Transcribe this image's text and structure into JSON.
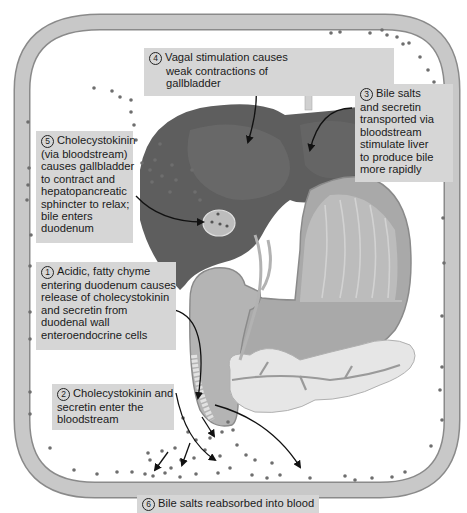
{
  "diagram": {
    "colors": {
      "blood_vessel_fill": "#c8c8c8",
      "blood_vessel_stroke": "#8a8a8a",
      "hormone_dot": "#6e6e6e",
      "label_background": "#d6d6d6",
      "liver": "#5e5e5e",
      "stomach": "#a9a9a9",
      "pancreas": "#e6e6e6",
      "arrow": "#111111"
    },
    "organs": [
      "liver",
      "gallbladder",
      "stomach",
      "duodenum",
      "pancreas",
      "bloodstream"
    ],
    "steps": [
      {
        "number": "1",
        "lines": [
          "Acidic, fatty chyme",
          "entering duodenum causes",
          "release of cholecystokinin",
          "and secretin from",
          "duodenal wall",
          "enteroendocrine cells"
        ]
      },
      {
        "number": "2",
        "lines": [
          "Cholecystokinin and",
          "secretin enter the",
          "bloodstream"
        ]
      },
      {
        "number": "3",
        "lines": [
          "Bile salts",
          "and secretin",
          "transported via",
          "bloodstream",
          "stimulate liver",
          "to produce bile",
          "more rapidly"
        ]
      },
      {
        "number": "4",
        "lines": [
          "Vagal stimulation causes",
          "weak contractions of",
          "gallbladder"
        ]
      },
      {
        "number": "5",
        "lines": [
          "Cholecystokinin",
          "(via bloodstream)",
          "causes gallbladder",
          "to contract and",
          "hepatopancreatic",
          "sphincter to relax;",
          "bile enters",
          "duodenum"
        ]
      },
      {
        "number": "6",
        "lines": [
          "Bile salts reabsorbed into blood"
        ]
      }
    ]
  }
}
